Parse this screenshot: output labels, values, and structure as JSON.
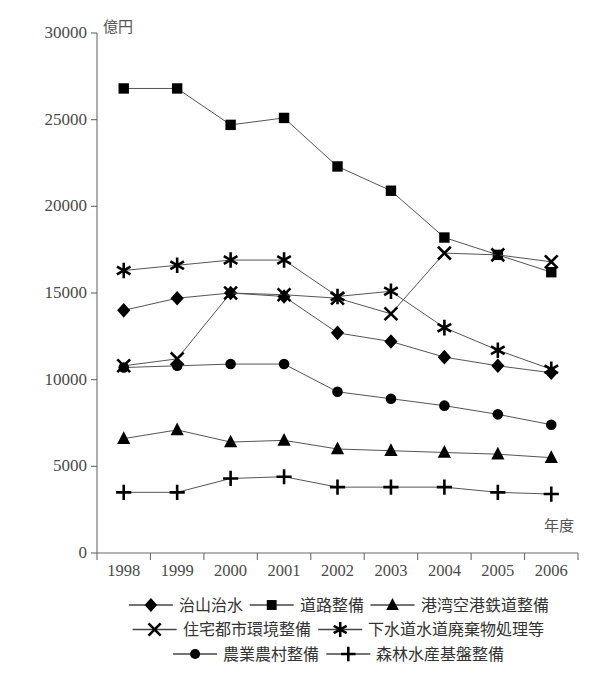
{
  "chart_data": {
    "type": "line",
    "title": "",
    "xlabel": "年度",
    "ylabel": "億円",
    "ylim": [
      0,
      30000
    ],
    "ytick_values": [
      0,
      5000,
      10000,
      15000,
      20000,
      25000,
      30000
    ],
    "ytick_labels": [
      "0",
      "5000",
      "10000",
      "15000",
      "20000",
      "25000",
      "30000"
    ],
    "grid": false,
    "legend_position": "bottom",
    "categories": [
      "1998",
      "1999",
      "2000",
      "2001",
      "2002",
      "2003",
      "2004",
      "2005",
      "2006"
    ],
    "series": [
      {
        "name": "治山治水",
        "marker": "diamond",
        "values": [
          14000,
          14700,
          15000,
          14800,
          12700,
          12200,
          11300,
          10800,
          10400
        ]
      },
      {
        "name": "道路整備",
        "marker": "square",
        "values": [
          26800,
          26800,
          24700,
          25100,
          22300,
          20900,
          18200,
          17200,
          16200
        ]
      },
      {
        "name": "港湾空港鉄道整備",
        "marker": "triangle",
        "values": [
          6600,
          7100,
          6400,
          6500,
          6000,
          5900,
          5800,
          5700,
          5500
        ]
      },
      {
        "name": "住宅都市環境整備",
        "marker": "cross",
        "values": [
          10800,
          11200,
          15000,
          14900,
          14700,
          13800,
          17300,
          17200,
          16800
        ]
      },
      {
        "name": "下水道水道廃棄物処理等",
        "marker": "asterisk",
        "values": [
          16300,
          16600,
          16900,
          16900,
          14800,
          15100,
          13000,
          11700,
          10600
        ]
      },
      {
        "name": "農業農村整備",
        "marker": "circle",
        "values": [
          10700,
          10800,
          10900,
          10900,
          9300,
          8900,
          8500,
          8000,
          7400
        ]
      },
      {
        "name": "森林水産基盤整備",
        "marker": "plus",
        "values": [
          3500,
          3500,
          4300,
          4400,
          3800,
          3800,
          3800,
          3500,
          3400
        ]
      }
    ],
    "legend_rows": [
      [
        "治山治水",
        "道路整備",
        "港湾空港鉄道整備"
      ],
      [
        "住宅都市環境整備",
        "下水道水道廃棄物処理等"
      ],
      [
        "農業農村整備",
        "森林水産基盤整備"
      ]
    ],
    "colors": {
      "axis": "#6b6b6b",
      "line": "#555555",
      "marker": "#000000",
      "tick_text": "#4a4a4a",
      "background": "#ffffff"
    }
  }
}
